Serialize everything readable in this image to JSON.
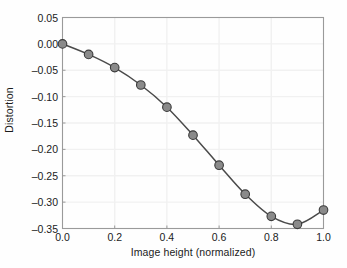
{
  "chart_data": {
    "type": "line",
    "title": "",
    "subtitle": "",
    "xlabel": "Image height (normalized)",
    "ylabel": "Distortion",
    "xlim": [
      0.0,
      1.0
    ],
    "ylim": [
      -0.35,
      0.05
    ],
    "grid": true,
    "legend": null,
    "legend_position": "none",
    "marker": "filled-circle",
    "marker_color": "#8a8a8a",
    "marker_edge_color": "#3a3a3a",
    "line_color": "#4a4a4a",
    "x": [
      0.0,
      0.1,
      0.2,
      0.3,
      0.4,
      0.5,
      0.6,
      0.7,
      0.8,
      0.9,
      1.0
    ],
    "values": [
      0.0,
      -0.02,
      -0.045,
      -0.078,
      -0.12,
      -0.173,
      -0.23,
      -0.285,
      -0.327,
      -0.342,
      -0.315
    ],
    "series": [
      {
        "name": "Distortion",
        "x": [
          0.0,
          0.1,
          0.2,
          0.3,
          0.4,
          0.5,
          0.6,
          0.7,
          0.8,
          0.9,
          1.0
        ],
        "values": [
          0.0,
          -0.02,
          -0.045,
          -0.078,
          -0.12,
          -0.173,
          -0.23,
          -0.285,
          -0.327,
          -0.342,
          -0.315
        ]
      }
    ],
    "xticks": [
      0.0,
      0.2,
      0.4,
      0.6,
      0.8,
      1.0
    ],
    "xticklabels": [
      "0.0",
      "0.2",
      "0.4",
      "0.6",
      "0.8",
      "1.0"
    ],
    "yticks": [
      0.05,
      0.0,
      -0.05,
      -0.1,
      -0.15,
      -0.2,
      -0.25,
      -0.3,
      -0.35
    ],
    "yticklabels": [
      "0.05",
      "0.00",
      "–0.05",
      "–0.10",
      "–0.15",
      "–0.20",
      "–0.25",
      "–0.30",
      "–0.35"
    ],
    "annotations": []
  },
  "colors": {
    "background": "#fefefe",
    "axis": "#9a9a9a",
    "grid": "#f1f1f1",
    "text": "#1b1b1b",
    "line": "#4a4a4a",
    "marker_fill": "#8a8a8a",
    "marker_edge": "#3a3a3a"
  }
}
